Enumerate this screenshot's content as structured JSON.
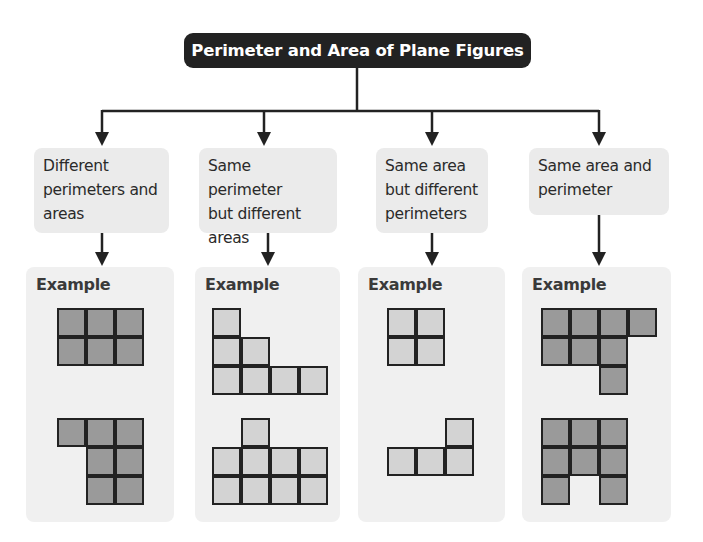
{
  "title": "Perimeter and Area of Plane Figures",
  "colors": {
    "title_bg": "#222222",
    "title_text": "#ffffff",
    "category_bg": "#ebebeb",
    "panel_bg": "#f0f0f0",
    "cell_dark": "#9a9a9a",
    "cell_light": "#d3d3d3",
    "line": "#222222"
  },
  "categories": [
    {
      "label": "Different perimeters and areas",
      "lines": [
        "Different",
        "perimeters and",
        "areas"
      ],
      "example_label": "Example",
      "shade": "dark",
      "shapes": [
        {
          "rows": [
            [
              1,
              1,
              1
            ],
            [
              1,
              1,
              1
            ]
          ]
        },
        {
          "rows": [
            [
              1,
              1,
              1
            ],
            [
              0,
              1,
              1
            ],
            [
              0,
              1,
              1
            ]
          ]
        }
      ]
    },
    {
      "label": "Same perimeter but different areas",
      "lines": [
        "Same perimeter",
        "but different",
        "areas"
      ],
      "example_label": "Example",
      "shade": "light",
      "shapes": [
        {
          "rows": [
            [
              1,
              0,
              0,
              0
            ],
            [
              1,
              1,
              0,
              0
            ],
            [
              1,
              1,
              1,
              1
            ]
          ]
        },
        {
          "rows": [
            [
              0,
              1,
              0,
              0
            ],
            [
              1,
              1,
              1,
              1
            ],
            [
              1,
              1,
              1,
              1
            ]
          ]
        }
      ]
    },
    {
      "label": "Same area but different perimeters",
      "lines": [
        "Same area",
        "but different",
        "perimeters"
      ],
      "example_label": "Example",
      "shade": "light",
      "shapes": [
        {
          "rows": [
            [
              1,
              1
            ],
            [
              1,
              1
            ]
          ]
        },
        {
          "rows": [
            [
              0,
              0,
              1
            ],
            [
              1,
              1,
              1
            ]
          ]
        }
      ]
    },
    {
      "label": "Same area and perimeter",
      "lines": [
        "Same area and",
        "perimeter"
      ],
      "example_label": "Example",
      "shade": "dark",
      "shapes": [
        {
          "rows": [
            [
              1,
              1,
              1,
              1
            ],
            [
              1,
              1,
              1,
              0
            ],
            [
              0,
              0,
              1,
              0
            ]
          ]
        },
        {
          "rows": [
            [
              1,
              1,
              1
            ],
            [
              1,
              1,
              1
            ],
            [
              1,
              0,
              1
            ]
          ]
        }
      ]
    }
  ]
}
